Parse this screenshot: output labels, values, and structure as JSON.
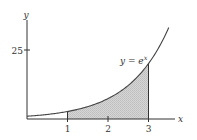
{
  "chart_data": {
    "type": "area",
    "title": "",
    "function_label": "y = e^x",
    "function_label_parts": {
      "lhs": "y = e",
      "sup": "x"
    },
    "xlabel": "x",
    "ylabel": "y",
    "x_ticks": [
      {
        "value": 1,
        "label": "1"
      },
      {
        "value": 2,
        "label": "2"
      },
      {
        "value": 3,
        "label": "3"
      }
    ],
    "y_ticks": [
      {
        "value": 25,
        "label": "25"
      }
    ],
    "xlim": [
      0,
      3.6
    ],
    "ylim": [
      0,
      33
    ],
    "grid": false,
    "legend": null,
    "curve": {
      "expression": "e^x",
      "x_range": [
        0,
        3.5
      ],
      "points": [
        {
          "x": 0,
          "y": 1
        },
        {
          "x": 0.5,
          "y": 1.65
        },
        {
          "x": 1,
          "y": 2.72
        },
        {
          "x": 1.5,
          "y": 4.48
        },
        {
          "x": 2,
          "y": 7.39
        },
        {
          "x": 2.5,
          "y": 12.18
        },
        {
          "x": 3,
          "y": 20.09
        },
        {
          "x": 3.5,
          "y": 33.12
        }
      ],
      "color": "#444444"
    },
    "shaded_region": {
      "x_from": 1,
      "x_to": 3,
      "fill": "#cfcfcf",
      "description": "area under y = e^x between x = 1 and x = 3"
    }
  },
  "colors": {
    "axis": "#333333",
    "curve": "#444444",
    "shade": "#cfcfcf",
    "background": "#ffffff"
  }
}
